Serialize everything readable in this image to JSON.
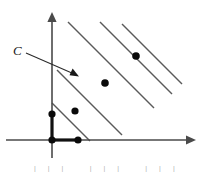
{
  "figure": {
    "label": "C",
    "background_color": "#ffffff",
    "line_color": "#5a5a5a",
    "axis_color": "#4a4a4a",
    "dot_color": "#0a0a0a",
    "hull_color": "#111111"
  },
  "axes": {
    "x_axis": {
      "name": "horizontal-axis",
      "y": 140,
      "x_start": 6,
      "x_end": 196,
      "has_arrow": true,
      "arrow_direction": "right"
    },
    "y_axis": {
      "name": "vertical-axis",
      "x": 52,
      "y_start": 158,
      "y_end": 12,
      "has_arrow": true,
      "arrow_direction": "up"
    },
    "origin": {
      "x": 52,
      "y": 140
    }
  },
  "parallel_lines": {
    "count": 5,
    "slope": -1,
    "segments": [
      {
        "x1": 52,
        "y1": 103,
        "x2": 90,
        "y2": 141
      },
      {
        "x1": 57,
        "y1": 70,
        "x2": 122,
        "y2": 135
      },
      {
        "x1": 68,
        "y1": 22,
        "x2": 154,
        "y2": 108
      },
      {
        "x1": 100,
        "y1": 22,
        "x2": 172,
        "y2": 94
      },
      {
        "x1": 122,
        "y1": 24,
        "x2": 182,
        "y2": 84
      }
    ]
  },
  "lattice_points": [
    {
      "name": "point-on-y-axis",
      "x": 52,
      "y": 114,
      "radius": 3.6
    },
    {
      "name": "point-at-origin",
      "x": 52,
      "y": 140,
      "radius": 3.6
    },
    {
      "name": "point-on-x-axis",
      "x": 78,
      "y": 140,
      "radius": 3.6
    },
    {
      "name": "point-lower-left",
      "x": 75,
      "y": 111,
      "radius": 3.6
    },
    {
      "name": "point-middle",
      "x": 105,
      "y": 83,
      "radius": 3.8
    },
    {
      "name": "point-upper",
      "x": 136,
      "y": 56,
      "radius": 3.8
    }
  ],
  "hull_edges": [
    {
      "name": "vertical-hull-edge",
      "x1": 52,
      "y1": 114,
      "x2": 52,
      "y2": 140
    },
    {
      "name": "horizontal-hull-edge",
      "x1": 52,
      "y1": 140,
      "x2": 78,
      "y2": 140
    }
  ],
  "annotation": {
    "label": "C",
    "label_x": 13,
    "label_y": 55,
    "pointer": {
      "x1": 26,
      "y1": 53,
      "x2": 74,
      "y2": 74
    },
    "arrow_tip": {
      "x": 78,
      "y": 76
    }
  },
  "caption_fragment": {
    "visible": true,
    "text": "|||   |||   |||"
  }
}
